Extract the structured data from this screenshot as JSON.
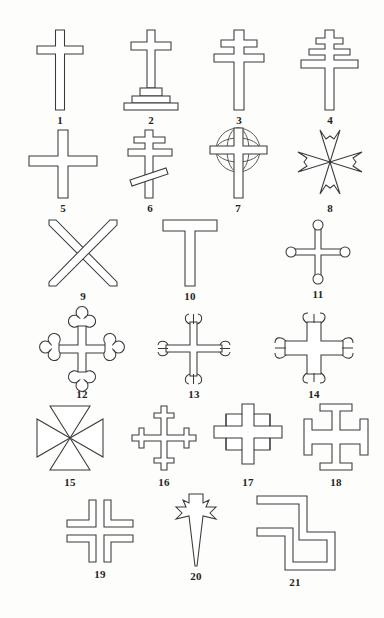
{
  "plate": {
    "title": "Plate of Cross Forms",
    "background_color": "#fdfdfb",
    "ink_color": "#3a3a3a",
    "figure_count": 21,
    "rows": 6,
    "columns": 4
  },
  "figures": [
    {
      "number": "1",
      "name": "latin-cross",
      "label": "1"
    },
    {
      "number": "2",
      "name": "calvary-cross-on-steps",
      "label": "2"
    },
    {
      "number": "3",
      "name": "patriarchal-cross",
      "label": "3"
    },
    {
      "number": "4",
      "name": "papal-cross",
      "label": "4"
    },
    {
      "number": "5",
      "name": "greek-cross",
      "label": "5"
    },
    {
      "number": "6",
      "name": "russian-orthodox-cross",
      "label": "6"
    },
    {
      "number": "7",
      "name": "celtic-cross",
      "label": "7"
    },
    {
      "number": "8",
      "name": "maltese-cross",
      "label": "8"
    },
    {
      "number": "9",
      "name": "saltire-cross",
      "label": "9"
    },
    {
      "number": "10",
      "name": "tau-cross",
      "label": "10"
    },
    {
      "number": "11",
      "name": "cross-pommee",
      "label": "11"
    },
    {
      "number": "12",
      "name": "cross-botonee",
      "label": "12"
    },
    {
      "number": "13",
      "name": "cross-fleury",
      "label": "13"
    },
    {
      "number": "14",
      "name": "cross-flory-broad",
      "label": "14"
    },
    {
      "number": "15",
      "name": "cross-pattee-concave",
      "label": "15"
    },
    {
      "number": "16",
      "name": "cross-crosslet",
      "label": "16"
    },
    {
      "number": "17",
      "name": "cross-stepped-square",
      "label": "17"
    },
    {
      "number": "18",
      "name": "cross-potent",
      "label": "18"
    },
    {
      "number": "19",
      "name": "cross-cantonned-split",
      "label": "19"
    },
    {
      "number": "20",
      "name": "cross-dagger-pointed",
      "label": "20"
    },
    {
      "number": "21",
      "name": "gammadion-fylfot",
      "label": "21"
    }
  ]
}
